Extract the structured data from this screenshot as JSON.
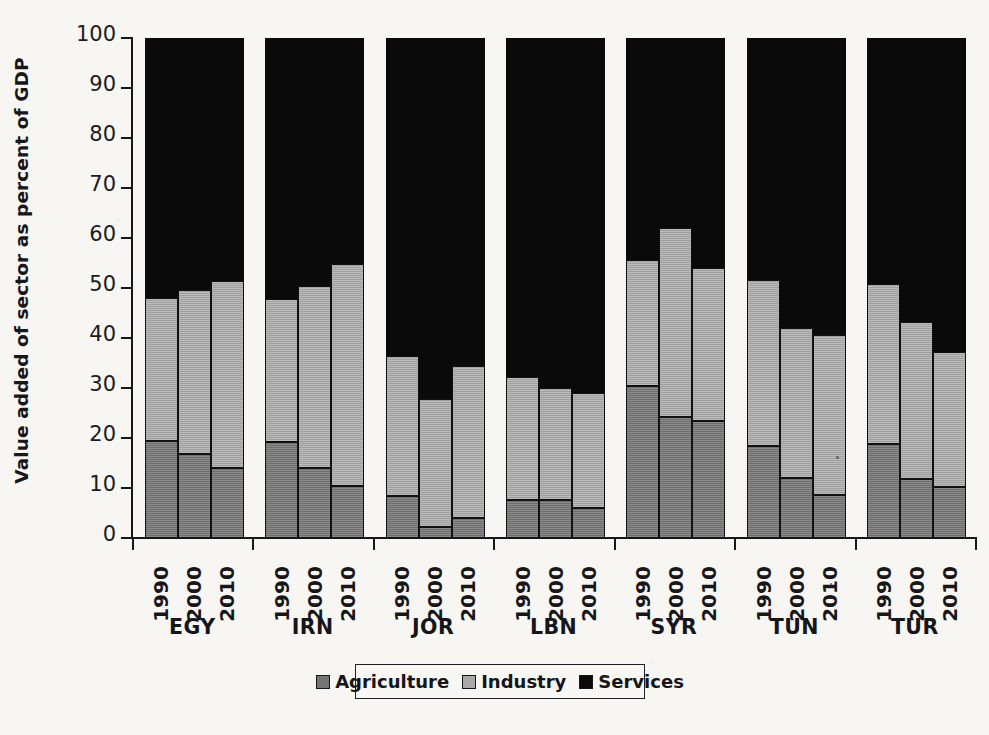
{
  "chart_data": {
    "type": "bar",
    "subtype": "stacked-bar-100-percent",
    "title": "",
    "xlabel": "",
    "ylabel": "Value added of sector as percent of GDP",
    "ylim": [
      0,
      100
    ],
    "yticks": [
      0,
      10,
      20,
      30,
      40,
      50,
      60,
      70,
      80,
      90,
      100
    ],
    "grid": false,
    "legend_position": "bottom-center",
    "legend": [
      "Agriculture",
      "Industry",
      "Services"
    ],
    "colors": {
      "agriculture": "#757575",
      "industry": "#a9a9a9",
      "services": "#0a0a0a"
    },
    "groups": [
      "EGY",
      "IRN",
      "JOR",
      "LBN",
      "SYR",
      "TUN",
      "TUR"
    ],
    "subcategories": [
      "1990",
      "2000",
      "2010"
    ],
    "categories": [
      "EGY 1990",
      "EGY 2000",
      "EGY 2010",
      "IRN 1990",
      "IRN 2000",
      "IRN 2010",
      "JOR 1990",
      "JOR 2000",
      "JOR 2010",
      "LBN 1990",
      "LBN 2000",
      "LBN 2010",
      "SYR 1990",
      "SYR 2000",
      "SYR 2010",
      "TUN 1990",
      "TUN 2000",
      "TUN 2010",
      "TUR 1990",
      "TUR 2000",
      "TUR 2010"
    ],
    "series": [
      {
        "name": "Agriculture",
        "values": [
          19.4,
          16.9,
          14.1,
          19.3,
          14.0,
          10.5,
          8.5,
          2.2,
          4.0,
          7.7,
          7.7,
          6.0,
          30.4,
          24.2,
          23.4,
          18.4,
          12.0,
          8.7,
          18.9,
          11.9,
          10.3
        ]
      },
      {
        "name": "Industry",
        "values": [
          28.6,
          32.8,
          37.3,
          28.6,
          36.5,
          44.3,
          28.0,
          25.7,
          30.4,
          24.5,
          22.4,
          23.0,
          25.2,
          37.8,
          30.6,
          33.3,
          30.0,
          32.0,
          31.9,
          31.3,
          26.9
        ]
      },
      {
        "name": "Services",
        "values": [
          52.0,
          50.3,
          48.6,
          52.1,
          49.5,
          45.2,
          63.5,
          72.1,
          65.6,
          67.8,
          69.9,
          71.0,
          44.4,
          38.0,
          46.0,
          48.3,
          58.0,
          59.3,
          49.2,
          56.8,
          62.8
        ]
      }
    ],
    "stack_tops": {
      "agriculture": [
        19.4,
        16.9,
        14.1,
        19.3,
        14.0,
        10.5,
        8.5,
        2.2,
        4.0,
        7.7,
        7.7,
        6.0,
        30.4,
        24.2,
        23.4,
        18.4,
        12.0,
        8.7,
        18.9,
        11.9,
        10.3
      ],
      "industry": [
        48.0,
        49.7,
        51.4,
        47.9,
        50.5,
        54.8,
        36.5,
        27.9,
        34.4,
        32.2,
        30.1,
        29.0,
        55.6,
        62.0,
        54.0,
        51.7,
        42.0,
        40.7,
        50.8,
        43.2,
        37.2
      ],
      "services": [
        100,
        100,
        100,
        100,
        100,
        100,
        100,
        100,
        100,
        100,
        100,
        100,
        100,
        100,
        100,
        100,
        100,
        100,
        100,
        100,
        100
      ]
    }
  },
  "axis": {
    "y_title": "Value added of sector as percent of GDP",
    "y_tick_labels": [
      "100",
      "90",
      "80",
      "70",
      "60",
      "50",
      "40",
      "30",
      "20",
      "10",
      "0"
    ],
    "year_labels": [
      "1990",
      "2000",
      "2010"
    ],
    "country_labels": [
      "EGY",
      "IRN",
      "JOR",
      "LBN",
      "SYR",
      "TUN",
      "TUR"
    ]
  },
  "legend": {
    "items": [
      {
        "label": "Agriculture",
        "swatch": "agriculture"
      },
      {
        "label": "Industry",
        "swatch": "industry"
      },
      {
        "label": "Services",
        "swatch": "services"
      }
    ]
  }
}
